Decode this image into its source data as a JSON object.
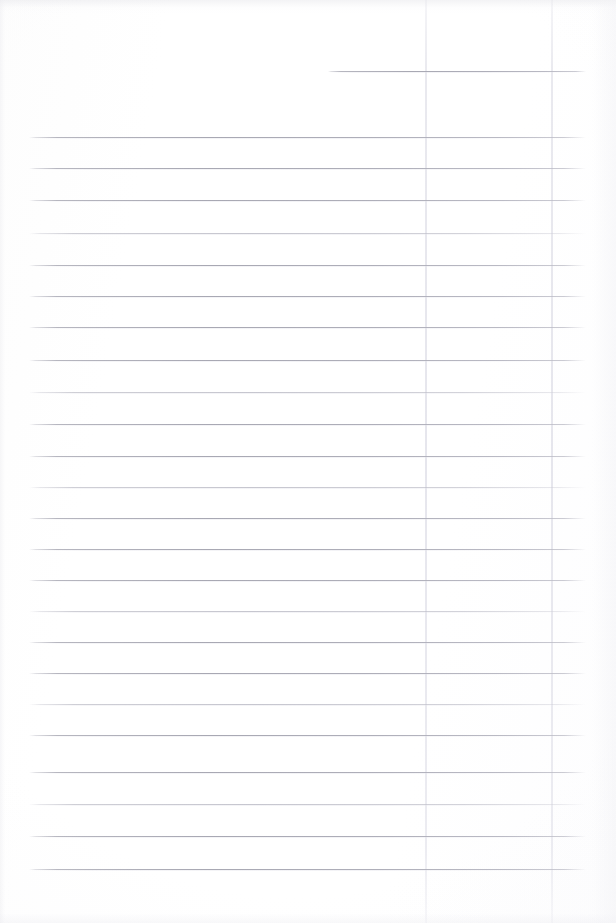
{
  "document": {
    "kind": "ruled-paper-scan",
    "title": "Blank ruled page",
    "page_width": 616,
    "page_height": 923,
    "background_color": "#fefefe",
    "has_text_content": false,
    "visible_text": ""
  },
  "rules": {
    "horizontal": {
      "count": 25,
      "color": "#aaaab3",
      "thickness_px": 1,
      "default_start_x": 29,
      "default_end_x": 586,
      "lines": [
        {
          "y": 71,
          "x1": 328,
          "x2": 586,
          "faint": false
        },
        {
          "y": 137,
          "x1": 29,
          "x2": 586,
          "faint": false
        },
        {
          "y": 168,
          "x1": 29,
          "x2": 586,
          "faint": false
        },
        {
          "y": 200,
          "x1": 29,
          "x2": 586,
          "faint": false
        },
        {
          "y": 233,
          "x1": 29,
          "x2": 586,
          "faint": true
        },
        {
          "y": 265,
          "x1": 29,
          "x2": 586,
          "faint": false
        },
        {
          "y": 296,
          "x1": 29,
          "x2": 586,
          "faint": false
        },
        {
          "y": 327,
          "x1": 29,
          "x2": 586,
          "faint": false
        },
        {
          "y": 360,
          "x1": 29,
          "x2": 586,
          "faint": false
        },
        {
          "y": 392,
          "x1": 29,
          "x2": 586,
          "faint": true
        },
        {
          "y": 424,
          "x1": 29,
          "x2": 586,
          "faint": false
        },
        {
          "y": 456,
          "x1": 29,
          "x2": 586,
          "faint": false
        },
        {
          "y": 487,
          "x1": 29,
          "x2": 586,
          "faint": true
        },
        {
          "y": 518,
          "x1": 29,
          "x2": 586,
          "faint": false
        },
        {
          "y": 549,
          "x1": 29,
          "x2": 586,
          "faint": false
        },
        {
          "y": 580,
          "x1": 29,
          "x2": 586,
          "faint": false
        },
        {
          "y": 611,
          "x1": 29,
          "x2": 586,
          "faint": true
        },
        {
          "y": 642,
          "x1": 29,
          "x2": 586,
          "faint": false
        },
        {
          "y": 673,
          "x1": 29,
          "x2": 586,
          "faint": false
        },
        {
          "y": 704,
          "x1": 29,
          "x2": 586,
          "faint": true
        },
        {
          "y": 735,
          "x1": 29,
          "x2": 586,
          "faint": false
        },
        {
          "y": 772,
          "x1": 29,
          "x2": 586,
          "faint": false
        },
        {
          "y": 804,
          "x1": 29,
          "x2": 586,
          "faint": true
        },
        {
          "y": 836,
          "x1": 29,
          "x2": 586,
          "faint": false
        },
        {
          "y": 869,
          "x1": 29,
          "x2": 586,
          "faint": false
        }
      ]
    },
    "vertical": {
      "count": 2,
      "color": "#e6e6ed",
      "thickness_px": 2,
      "lines": [
        {
          "x": 425,
          "y1": 0,
          "y2": 923
        },
        {
          "x": 551,
          "y1": 0,
          "y2": 923
        }
      ]
    }
  }
}
